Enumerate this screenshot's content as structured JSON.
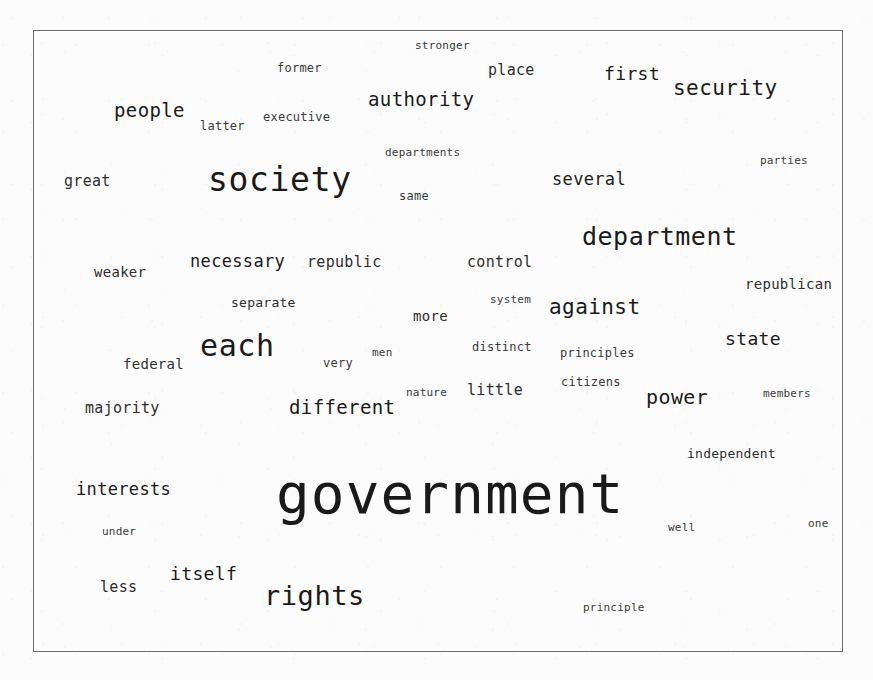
{
  "figure": {
    "type": "word-cloud",
    "title": "",
    "background_color": "#fcfcfc",
    "border_color": "#6d6d6d",
    "text_color": "#1a1a1a",
    "frame": {
      "x": 33,
      "y": 30,
      "width": 810,
      "height": 622
    }
  },
  "chart_data": {
    "type": "word-cloud",
    "title": "",
    "subtitle": "",
    "xlabel": "",
    "ylabel": "",
    "legend": [],
    "note": "Word sizes encode term frequency; larger font size = higher weight. Positions are the packed layout from the source image.",
    "words": [
      {
        "text": "government",
        "size": 56,
        "x": 276,
        "y": 466
      },
      {
        "text": "society",
        "size": 33,
        "x": 208,
        "y": 163
      },
      {
        "text": "each",
        "size": 30,
        "x": 200,
        "y": 331
      },
      {
        "text": "rights",
        "size": 27,
        "x": 264,
        "y": 582
      },
      {
        "text": "department",
        "size": 25,
        "x": 582,
        "y": 224
      },
      {
        "text": "security",
        "size": 21,
        "x": 673,
        "y": 78
      },
      {
        "text": "against",
        "size": 21,
        "x": 549,
        "y": 297
      },
      {
        "text": "authority",
        "size": 19,
        "x": 368,
        "y": 90
      },
      {
        "text": "power",
        "size": 20,
        "x": 646,
        "y": 387
      },
      {
        "text": "different",
        "size": 19,
        "x": 289,
        "y": 398
      },
      {
        "text": "people",
        "size": 19,
        "x": 114,
        "y": 101
      },
      {
        "text": "necessary",
        "size": 17,
        "x": 190,
        "y": 253
      },
      {
        "text": "interests",
        "size": 17,
        "x": 76,
        "y": 481
      },
      {
        "text": "several",
        "size": 17,
        "x": 552,
        "y": 171
      },
      {
        "text": "first",
        "size": 18,
        "x": 604,
        "y": 65
      },
      {
        "text": "state",
        "size": 18,
        "x": 725,
        "y": 330
      },
      {
        "text": "itself",
        "size": 18,
        "x": 170,
        "y": 565
      },
      {
        "text": "republic",
        "size": 15,
        "x": 307,
        "y": 255
      },
      {
        "text": "control",
        "size": 15,
        "x": 467,
        "y": 255
      },
      {
        "text": "federal",
        "size": 14,
        "x": 123,
        "y": 357
      },
      {
        "text": "majority",
        "size": 15,
        "x": 85,
        "y": 401
      },
      {
        "text": "weaker",
        "size": 14,
        "x": 94,
        "y": 265
      },
      {
        "text": "great",
        "size": 15,
        "x": 64,
        "y": 174
      },
      {
        "text": "separate",
        "size": 13,
        "x": 231,
        "y": 296
      },
      {
        "text": "less",
        "size": 15,
        "x": 100,
        "y": 580
      },
      {
        "text": "more",
        "size": 14,
        "x": 413,
        "y": 309
      },
      {
        "text": "little",
        "size": 15,
        "x": 467,
        "y": 383
      },
      {
        "text": "place",
        "size": 15,
        "x": 488,
        "y": 63
      },
      {
        "text": "republican",
        "size": 14,
        "x": 745,
        "y": 277
      },
      {
        "text": "independent",
        "size": 13,
        "x": 687,
        "y": 447
      },
      {
        "text": "executive",
        "size": 12,
        "x": 263,
        "y": 111
      },
      {
        "text": "departments",
        "size": 11,
        "x": 385,
        "y": 147
      },
      {
        "text": "stronger",
        "size": 11,
        "x": 415,
        "y": 40
      },
      {
        "text": "former",
        "size": 12,
        "x": 277,
        "y": 62
      },
      {
        "text": "latter",
        "size": 12,
        "x": 200,
        "y": 120
      },
      {
        "text": "same",
        "size": 12,
        "x": 399,
        "y": 190
      },
      {
        "text": "parties",
        "size": 11,
        "x": 760,
        "y": 155
      },
      {
        "text": "system",
        "size": 11,
        "x": 490,
        "y": 294
      },
      {
        "text": "distinct",
        "size": 12,
        "x": 472,
        "y": 341
      },
      {
        "text": "principles",
        "size": 12,
        "x": 560,
        "y": 347
      },
      {
        "text": "citizens",
        "size": 12,
        "x": 561,
        "y": 376
      },
      {
        "text": "men",
        "size": 11,
        "x": 372,
        "y": 347
      },
      {
        "text": "very",
        "size": 12,
        "x": 323,
        "y": 357
      },
      {
        "text": "nature",
        "size": 11,
        "x": 406,
        "y": 387
      },
      {
        "text": "members",
        "size": 11,
        "x": 763,
        "y": 388
      },
      {
        "text": "under",
        "size": 11,
        "x": 102,
        "y": 526
      },
      {
        "text": "well",
        "size": 11,
        "x": 668,
        "y": 522
      },
      {
        "text": "one",
        "size": 11,
        "x": 808,
        "y": 518
      },
      {
        "text": "principle",
        "size": 11,
        "x": 583,
        "y": 602
      }
    ]
  }
}
